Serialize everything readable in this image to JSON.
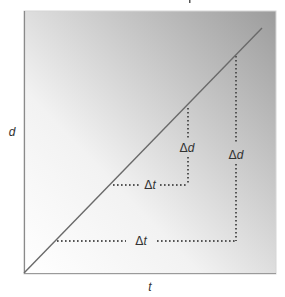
{
  "diagram": {
    "title_fragment": "",
    "axes": {
      "x_label": "t",
      "y_label": "d"
    },
    "background": {
      "gradient_from": "#ffffff",
      "gradient_to": "#9c9c9c",
      "frame_color": "#d8d8d8"
    },
    "line": {
      "color": "#666666",
      "description": "straight line from origin, constant slope"
    },
    "small_triangle": {
      "delta_t_label": "t",
      "delta_d_label": "d",
      "delta_symbol": "Δ"
    },
    "large_triangle": {
      "delta_t_label": "t",
      "delta_d_label": "d",
      "delta_symbol": "Δ"
    },
    "dotted_color": "#555555"
  }
}
